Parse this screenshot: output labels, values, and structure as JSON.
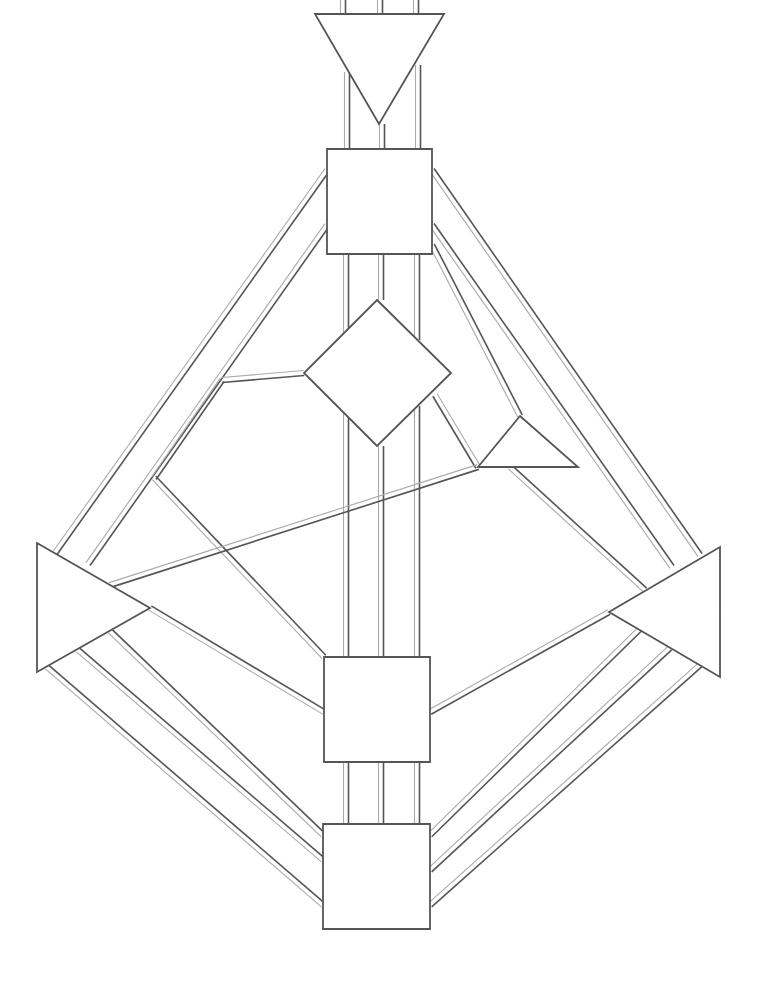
{
  "diagram": {
    "type": "bodygraph",
    "width": 765,
    "height": 982,
    "background": "#ffffff",
    "colors": {
      "outline": "#555555",
      "channel_dark": "#555555",
      "channel_light": "#aaaaaa",
      "fill": "#ffffff"
    },
    "channel_gap": 5,
    "centers": [
      {
        "id": "head",
        "shape": "triangle-down",
        "points": [
          [
            315,
            14
          ],
          [
            444,
            14
          ],
          [
            379,
            124
          ]
        ]
      },
      {
        "id": "throat",
        "shape": "square",
        "points": [
          [
            327,
            149
          ],
          [
            432,
            149
          ],
          [
            432,
            254
          ],
          [
            327,
            254
          ]
        ]
      },
      {
        "id": "g-center",
        "shape": "diamond",
        "points": [
          [
            377,
            300
          ],
          [
            451,
            373
          ],
          [
            377,
            446
          ],
          [
            304,
            373
          ]
        ]
      },
      {
        "id": "ego",
        "shape": "triangle",
        "points": [
          [
            520,
            416
          ],
          [
            578,
            467
          ],
          [
            478,
            467
          ]
        ]
      },
      {
        "id": "spleen",
        "shape": "triangle-right",
        "points": [
          [
            37,
            543
          ],
          [
            150,
            608
          ],
          [
            37,
            672
          ]
        ]
      },
      {
        "id": "solar-plexus",
        "shape": "triangle-left",
        "points": [
          [
            720,
            547
          ],
          [
            720,
            677
          ],
          [
            609,
            612
          ]
        ]
      },
      {
        "id": "sacral",
        "shape": "square",
        "points": [
          [
            324,
            657
          ],
          [
            430,
            657
          ],
          [
            430,
            762
          ],
          [
            324,
            762
          ]
        ]
      },
      {
        "id": "root",
        "shape": "square",
        "points": [
          [
            323,
            824
          ],
          [
            430,
            824
          ],
          [
            430,
            929
          ],
          [
            323,
            929
          ]
        ]
      }
    ],
    "channels": [
      {
        "id": "top-1",
        "from": [
          343,
          0
        ],
        "to": [
          343,
          14
        ]
      },
      {
        "id": "top-2",
        "from": [
          380,
          0
        ],
        "to": [
          380,
          14
        ]
      },
      {
        "id": "top-3",
        "from": [
          416,
          0
        ],
        "to": [
          416,
          14
        ]
      },
      {
        "id": "head-throat-1",
        "from": [
          347,
          72
        ],
        "to": [
          347,
          149
        ]
      },
      {
        "id": "head-throat-2",
        "from": [
          382,
          124
        ],
        "to": [
          382,
          149
        ]
      },
      {
        "id": "head-throat-3",
        "from": [
          418,
          65
        ],
        "to": [
          418,
          149
        ]
      },
      {
        "id": "throat-g-1",
        "from": [
          346,
          254
        ],
        "to": [
          346,
          392
        ]
      },
      {
        "id": "throat-g-2",
        "from": [
          381,
          254
        ],
        "to": [
          381,
          300
        ]
      },
      {
        "id": "throat-g-3",
        "from": [
          417,
          254
        ],
        "to": [
          417,
          340
        ]
      },
      {
        "id": "g-sacral-1",
        "from": [
          346,
          392
        ],
        "to": [
          346,
          657
        ]
      },
      {
        "id": "g-sacral-2",
        "from": [
          381,
          446
        ],
        "to": [
          381,
          657
        ]
      },
      {
        "id": "g-sacral-3",
        "from": [
          417,
          406
        ],
        "to": [
          417,
          657
        ]
      },
      {
        "id": "sacral-root-1",
        "from": [
          346,
          762
        ],
        "to": [
          346,
          824
        ]
      },
      {
        "id": "sacral-root-2",
        "from": [
          381,
          762
        ],
        "to": [
          381,
          824
        ]
      },
      {
        "id": "sacral-root-3",
        "from": [
          417,
          762
        ],
        "to": [
          417,
          824
        ]
      },
      {
        "id": "throat-spleen-outer",
        "from": [
          327,
          170
        ],
        "to": [
          55,
          553
        ]
      },
      {
        "id": "throat-spleen-inner",
        "from": [
          327,
          225
        ],
        "to": [
          88,
          564
        ]
      },
      {
        "id": "throat-sp-outer",
        "from": [
          432,
          170
        ],
        "to": [
          700,
          555
        ]
      },
      {
        "id": "throat-sp-inner",
        "from": [
          432,
          225
        ],
        "to": [
          672,
          567
        ]
      },
      {
        "id": "throat-ego",
        "from": [
          432,
          245
        ],
        "to": [
          520,
          416
        ]
      },
      {
        "id": "g-spleen-branch",
        "from": [
          304,
          373
        ],
        "to": [
          222,
          380
        ]
      },
      {
        "id": "spleen-to-gbranch",
        "from": [
          222,
          380
        ],
        "to": [
          154,
          478
        ]
      },
      {
        "id": "spleen-sacral",
        "from": [
          154,
          478
        ],
        "to": [
          324,
          657
        ]
      },
      {
        "id": "ego-g",
        "from": [
          478,
          467
        ],
        "to": [
          435,
          395
        ]
      },
      {
        "id": "ego-spleen",
        "from": [
          478,
          467
        ],
        "to": [
          110,
          585
        ]
      },
      {
        "id": "ego-sp",
        "from": [
          510,
          467
        ],
        "to": [
          645,
          590
        ]
      },
      {
        "id": "spleen-sacral-lower",
        "from": [
          150,
          608
        ],
        "to": [
          324,
          712
        ]
      },
      {
        "id": "sp-sacral",
        "from": [
          609,
          612
        ],
        "to": [
          430,
          712
        ]
      },
      {
        "id": "spleen-root-1",
        "from": [
          47,
          667
        ],
        "to": [
          323,
          905
        ]
      },
      {
        "id": "spleen-root-2",
        "from": [
          78,
          650
        ],
        "to": [
          323,
          860
        ]
      },
      {
        "id": "spleen-root-3",
        "from": [
          110,
          631
        ],
        "to": [
          323,
          835
        ]
      },
      {
        "id": "sp-root-1",
        "from": [
          640,
          629
        ],
        "to": [
          430,
          835
        ]
      },
      {
        "id": "sp-root-2",
        "from": [
          670,
          648
        ],
        "to": [
          430,
          870
        ]
      },
      {
        "id": "sp-root-3",
        "from": [
          700,
          665
        ],
        "to": [
          430,
          905
        ]
      }
    ]
  }
}
